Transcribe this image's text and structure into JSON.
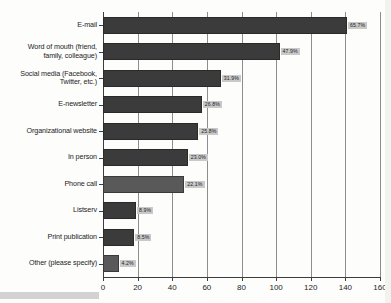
{
  "chart": {
    "type": "bar",
    "orientation": "horizontal",
    "title": "",
    "xlabel": "",
    "ylabel": "",
    "value_suffix": "%"
  },
  "chart_data": {
    "type": "bar",
    "title": "",
    "subtitle": "",
    "xlabel": "",
    "ylabel": "",
    "orientation": "horizontal",
    "xlim": [
      0,
      160
    ],
    "grid": true,
    "legend": "none",
    "xticks": [
      0,
      20,
      40,
      60,
      80,
      100,
      120,
      140,
      160
    ],
    "categories": [
      "E-mail",
      "Word of mouth (friend, family, colleague)",
      "Social media (Facebook, Twitter, etc.)",
      "E-newsletter",
      "Organizational website",
      "In person",
      "Phone call",
      "Listserv",
      "Print publication",
      "Other (please specify)"
    ],
    "values": [
      141,
      102,
      68,
      57,
      55,
      49,
      47,
      19,
      18,
      9
    ],
    "percent_labels": [
      "65.7%",
      "47.9%",
      "31.9%",
      "26.8%",
      "25.8%",
      "23.0%",
      "22.1%",
      "8.9%",
      "8.5%",
      "4.2%"
    ],
    "percents": [
      65.7,
      47.9,
      31.9,
      26.8,
      25.8,
      23.0,
      22.1,
      8.9,
      8.5,
      4.2
    ],
    "value_axis_label": "Response count",
    "colors": {
      "bar": "#3b3b3b",
      "bar_light": "#595959",
      "label_background": "#c9c9c9",
      "gridline": "#8d8d8d",
      "axis": "#3d3d3d",
      "text": "#1c1c1c",
      "background": "#fdfdfc"
    }
  },
  "axis": {
    "ticks": [
      {
        "label": "0",
        "value": 0
      },
      {
        "label": "20",
        "value": 20
      },
      {
        "label": "40",
        "value": 40
      },
      {
        "label": "60",
        "value": 60
      },
      {
        "label": "80",
        "value": 80
      },
      {
        "label": "100",
        "value": 100
      },
      {
        "label": "120",
        "value": 120
      },
      {
        "label": "140",
        "value": 140
      },
      {
        "label": "160",
        "value": 160
      }
    ]
  },
  "rows": [
    {
      "label": "E-mail",
      "label_line1": "E-mail",
      "label_line2": "",
      "value": 141,
      "percent": "65.7%",
      "style": "dark"
    },
    {
      "label": "Word of mouth (friend, family, colleague)",
      "label_line1": "Word of mouth (friend,",
      "label_line2": "family, colleague)",
      "value": 102,
      "percent": "47.9%",
      "style": "dark"
    },
    {
      "label": "Social media (Facebook, Twitter, etc.)",
      "label_line1": "Social media (Facebook,",
      "label_line2": "Twitter, etc.)",
      "value": 68,
      "percent": "31.9%",
      "style": "dark"
    },
    {
      "label": "E-newsletter",
      "label_line1": "E-newsletter",
      "label_line2": "",
      "value": 57,
      "percent": "26.8%",
      "style": "dark"
    },
    {
      "label": "Organizational website",
      "label_line1": "Organizational website",
      "label_line2": "",
      "value": 55,
      "percent": "25.8%",
      "style": "dark"
    },
    {
      "label": "In person",
      "label_line1": "In person",
      "label_line2": "",
      "value": 49,
      "percent": "23.0%",
      "style": "dark"
    },
    {
      "label": "Phone call",
      "label_line1": "Phone call",
      "label_line2": "",
      "value": 47,
      "percent": "22.1%",
      "style": "light"
    },
    {
      "label": "Listserv",
      "label_line1": "Listserv",
      "label_line2": "",
      "value": 19,
      "percent": "8.9%",
      "style": "dark"
    },
    {
      "label": "Print publication",
      "label_line1": "Print publication",
      "label_line2": "",
      "value": 18,
      "percent": "8.5%",
      "style": "dark"
    },
    {
      "label": "Other (please specify)",
      "label_line1": "Other (please specify)",
      "label_line2": "",
      "value": 9,
      "percent": "4.2%",
      "style": "light"
    }
  ]
}
